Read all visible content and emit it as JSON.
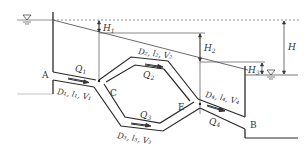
{
  "diagram": {
    "colors": {
      "line": "#2a2a2a",
      "thin": "#555555",
      "dashed": "#777777",
      "text": "#333333"
    },
    "nodes": {
      "A": "A",
      "B": "B",
      "C": "C",
      "E": "E"
    },
    "flows": {
      "q1": "Q",
      "q1_sub": "1",
      "q2": "Q",
      "q2_sub": "2",
      "q3": "Q",
      "q3_sub": "3",
      "q4": "Q",
      "q4_sub": "4"
    },
    "pipes": {
      "p1": "D₁, l₁, V₁",
      "p2": "D₂, l₂, V₂",
      "p3": "D₃, l₃, V₃",
      "p4": "D₄, l₄, V₄"
    },
    "heads": {
      "h1": "H",
      "h1_sub": "1",
      "h2": "H",
      "h2_sub": "2",
      "h3": "H",
      "h3_sub": "3",
      "h": "H"
    },
    "water_symbol": "▽"
  }
}
